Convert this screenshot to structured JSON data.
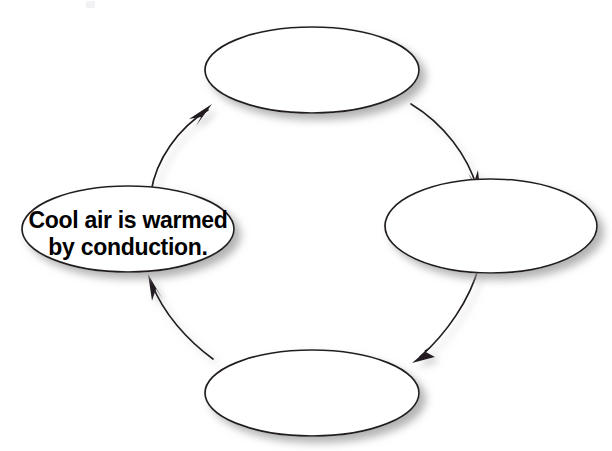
{
  "diagram": {
    "type": "cycle",
    "title": "",
    "direction": "clockwise",
    "node_count": 4,
    "nodes": [
      {
        "id": "top",
        "position": "top",
        "label": "",
        "cx": 312,
        "cy": 70,
        "rx": 107,
        "ry": 43,
        "empty": true
      },
      {
        "id": "right",
        "position": "right",
        "label": "",
        "cx": 491,
        "cy": 226,
        "rx": 106,
        "ry": 47,
        "empty": true
      },
      {
        "id": "bottom",
        "position": "bottom",
        "label": "",
        "cx": 312,
        "cy": 393,
        "rx": 107,
        "ry": 43,
        "empty": true
      },
      {
        "id": "left",
        "position": "left",
        "label": "Cool air is warmed by conduction.",
        "label_lines": [
          "Cool air is warmed",
          "by conduction."
        ],
        "cx": 128,
        "cy": 229,
        "rx": 106,
        "ry": 43,
        "empty": false
      }
    ],
    "connectors": [
      {
        "id": "left-to-top",
        "from": "left",
        "to": "top",
        "arrow": "arrowhead-end"
      },
      {
        "id": "top-to-right",
        "from": "top",
        "to": "right",
        "arrow": "arrowhead-end"
      },
      {
        "id": "right-to-bottom",
        "from": "right",
        "to": "bottom",
        "arrow": "arrowhead-end"
      },
      {
        "id": "bottom-to-left",
        "from": "bottom",
        "to": "left",
        "arrow": "arrowhead-end"
      }
    ],
    "colors": {
      "background": "#ffffff",
      "node_fill": "#ffffff",
      "stroke": "#231f20",
      "text": "#000000",
      "shadow": "#b8b8b8"
    }
  }
}
